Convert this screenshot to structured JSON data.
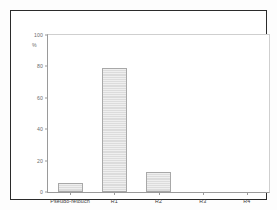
{
  "chart_data": {
    "type": "bar",
    "title": "",
    "subtitle": "",
    "xlabel": "",
    "ylabel": "%",
    "categories": [
      "Pseudo-retouch",
      "R1",
      "R2",
      "R3",
      "R4"
    ],
    "values": [
      6,
      79,
      13,
      0,
      0
    ],
    "ylim": [
      0,
      100
    ],
    "yticks": [
      0,
      20,
      40,
      60,
      80,
      100
    ],
    "ytick_labels": [
      "0",
      "20",
      "40",
      "60",
      "80",
      "100"
    ],
    "grid": false,
    "legend": null,
    "annotations": [],
    "bar_fill_color": "#dcdcdc",
    "bar_edge_color": "#a8a8a8",
    "axis_color": "#9a9a9a",
    "frame_color": "#2b2b2b",
    "background_color": "#ffffff"
  }
}
